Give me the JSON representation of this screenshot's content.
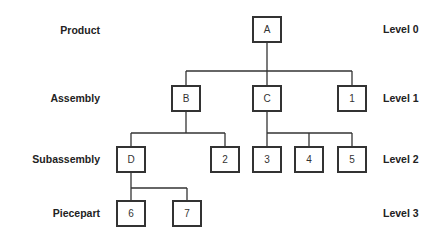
{
  "diagram": {
    "type": "product-structure-tree",
    "row_labels": [
      "Product",
      "Assembly",
      "Subassembly",
      "Piecepart"
    ],
    "level_labels": [
      "Level 0",
      "Level 1",
      "Level 2",
      "Level 3"
    ],
    "nodes": {
      "A": {
        "label": "A",
        "level": 0,
        "parent": null
      },
      "B": {
        "label": "B",
        "level": 1,
        "parent": "A"
      },
      "C": {
        "label": "C",
        "level": 1,
        "parent": "A"
      },
      "n1": {
        "label": "1",
        "level": 1,
        "parent": "A"
      },
      "D": {
        "label": "D",
        "level": 2,
        "parent": "B"
      },
      "n2": {
        "label": "2",
        "level": 2,
        "parent": "B"
      },
      "n3": {
        "label": "3",
        "level": 2,
        "parent": "C"
      },
      "n4": {
        "label": "4",
        "level": 2,
        "parent": "C"
      },
      "n5": {
        "label": "5",
        "level": 2,
        "parent": "C"
      },
      "n6": {
        "label": "6",
        "level": 3,
        "parent": "D"
      },
      "n7": {
        "label": "7",
        "level": 3,
        "parent": "D"
      }
    },
    "colors": {
      "line": "#333333",
      "text": "#222222",
      "background": "#ffffff"
    }
  }
}
